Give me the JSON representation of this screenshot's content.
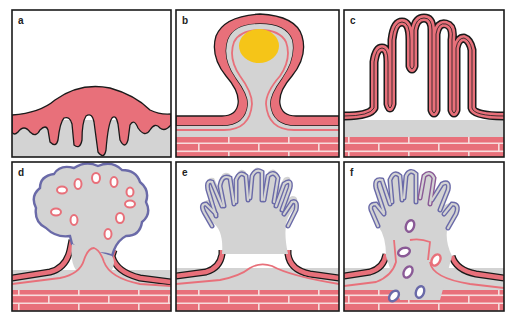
{
  "figure": {
    "panels": [
      {
        "id": "a",
        "label": "a"
      },
      {
        "id": "b",
        "label": "b"
      },
      {
        "id": "c",
        "label": "c"
      },
      {
        "id": "d",
        "label": "d"
      },
      {
        "id": "e",
        "label": "e"
      },
      {
        "id": "f",
        "label": "f"
      }
    ],
    "colors": {
      "epithelium": "#e8707a",
      "outline": "#1a1a1a",
      "tissue": "#d3d3d3",
      "yellow_body": "#f5c518",
      "blue_outline": "#6a6aa8",
      "brick": "#e8707a",
      "mortar": "#f7dcdc",
      "background": "#ffffff"
    }
  }
}
